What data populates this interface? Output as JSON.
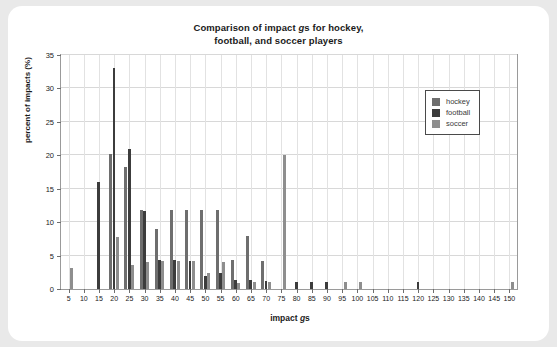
{
  "chart_data": {
    "type": "bar",
    "title": "Comparison of impact gs for hockey, football, and soccer players",
    "title_line1": "Comparison of impact ",
    "title_line1_italic": "g",
    "title_line1_end": "s for hockey,",
    "title_line2": "football, and soccer players",
    "xlabel": "impact gs",
    "xlabel_pre": "impact ",
    "xlabel_italic": "g",
    "xlabel_post": "s",
    "ylabel": "percent of impacts (%)",
    "xlim": [
      2.5,
      152.5
    ],
    "ylim": [
      0,
      35
    ],
    "yticks": [
      0,
      5,
      10,
      15,
      20,
      25,
      30,
      35
    ],
    "xticks": [
      5,
      10,
      15,
      20,
      25,
      30,
      35,
      40,
      45,
      50,
      55,
      60,
      65,
      70,
      75,
      80,
      85,
      90,
      95,
      100,
      105,
      110,
      115,
      120,
      125,
      130,
      135,
      140,
      145,
      150
    ],
    "grid": true,
    "legend_position": "upper right",
    "categories": [
      5,
      10,
      15,
      20,
      25,
      30,
      35,
      40,
      45,
      50,
      55,
      60,
      65,
      70,
      75,
      80,
      85,
      90,
      95,
      100,
      105,
      110,
      115,
      120,
      125,
      130,
      135,
      140,
      145,
      150
    ],
    "series": [
      {
        "name": "hockey",
        "color": "#6e6e6e",
        "values": [
          0,
          0,
          0,
          20.2,
          18.2,
          11.8,
          9.0,
          11.8,
          11.8,
          11.8,
          11.8,
          4.4,
          8.0,
          4.2,
          0,
          0,
          0,
          0,
          0,
          0,
          0,
          0,
          0,
          0,
          0,
          0,
          0,
          0,
          0,
          0
        ]
      },
      {
        "name": "football",
        "color": "#3c3c3c",
        "values": [
          0,
          0,
          16.0,
          33.0,
          21.0,
          11.7,
          4.4,
          4.4,
          4.2,
          1.9,
          2.4,
          1.3,
          1.3,
          1.2,
          0,
          1.0,
          1.0,
          1.0,
          0,
          0,
          0,
          0,
          0,
          1.0,
          0,
          0,
          0,
          0,
          0,
          0
        ]
      },
      {
        "name": "soccer",
        "color": "#8e8e8e",
        "values": [
          3.1,
          0,
          0,
          7.8,
          3.6,
          4.0,
          4.2,
          4.2,
          4.2,
          2.4,
          4.1,
          0.9,
          1.0,
          1.0,
          20.1,
          0,
          0,
          0,
          1.0,
          1.0,
          0,
          0,
          0,
          0,
          0,
          0,
          0,
          0,
          0,
          1.0
        ]
      }
    ],
    "legend": [
      {
        "label": "hockey",
        "color": "#6e6e6e"
      },
      {
        "label": "football",
        "color": "#3c3c3c"
      },
      {
        "label": "soccer",
        "color": "#8e8e8e"
      }
    ]
  }
}
